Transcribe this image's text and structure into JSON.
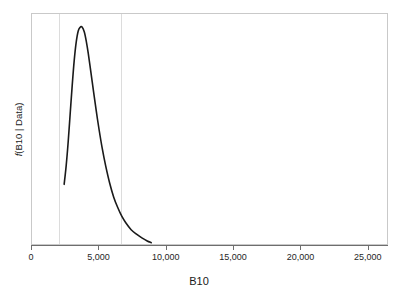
{
  "figure": {
    "background_color": "#ffffff",
    "frame_color": "#c9c9c9",
    "axis_color": "#6e6e6e",
    "curve_color": "#1a1a1a",
    "reference_line_color": "#dcdcdc"
  },
  "axes": {
    "x_title": "B10",
    "y_title_prefix": "f",
    "y_title_rest": "(B10 | Data)",
    "y_title_full": "f(B10 | Data)"
  },
  "chart_data": {
    "type": "line",
    "title": "",
    "subtitle": "",
    "xlabel": "B10",
    "ylabel": "f(B10 | Data)",
    "xlim": [
      0,
      26500
    ],
    "ylim": [
      0,
      1.06
    ],
    "grid": false,
    "legend": null,
    "x_ticks": [
      0,
      5000,
      10000,
      15000,
      20000,
      25000
    ],
    "x_tick_labels": [
      "0",
      "5,000",
      "10,000",
      "15,000",
      "20,000",
      "25,000"
    ],
    "y_ticks": [],
    "y_tick_labels": [],
    "annotations": [
      {
        "type": "vline",
        "x": 2020,
        "color": "#dcdcdc",
        "label": ""
      },
      {
        "type": "vline",
        "x": 6590,
        "color": "#dcdcdc",
        "label": ""
      }
    ],
    "series": [
      {
        "name": "Posterior density of B10",
        "color": "#1a1a1a",
        "linewidth": 1.6,
        "x": [
          2400,
          2550,
          2700,
          2850,
          3000,
          3150,
          3300,
          3450,
          3600,
          3740,
          3900,
          4050,
          4200,
          4400,
          4600,
          4800,
          5000,
          5250,
          5500,
          5800,
          6100,
          6400,
          6700,
          7000,
          7400,
          7800,
          8200,
          8600,
          8900
        ],
        "y": [
          0.275,
          0.36,
          0.47,
          0.6,
          0.73,
          0.845,
          0.93,
          0.982,
          0.999,
          1.0,
          0.978,
          0.935,
          0.878,
          0.79,
          0.7,
          0.612,
          0.53,
          0.438,
          0.36,
          0.28,
          0.216,
          0.168,
          0.128,
          0.098,
          0.066,
          0.045,
          0.028,
          0.014,
          0.006
        ]
      }
    ],
    "peak": {
      "x": 3740,
      "y": 1.0
    },
    "curve_start_x": 2400,
    "curve_end_x": 8900
  }
}
